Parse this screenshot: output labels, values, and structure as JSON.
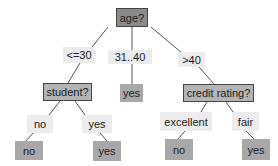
{
  "diagram": {
    "type": "decision-tree",
    "colors": {
      "root_fill": "#8a8a8a",
      "decision_fill": "#b4b4b4",
      "leaf_fill": "#a8a8a8",
      "edge_label_fill": "#ececec",
      "border": "#444444",
      "edge": "#555555"
    },
    "nodes": {
      "root": "age?",
      "student": "student?",
      "middle_leaf": "yes",
      "credit": "credit rating?",
      "student_no_leaf": "no",
      "student_yes_leaf": "yes",
      "credit_excellent_leaf": "no",
      "credit_fair_leaf": "yes"
    },
    "edge_labels": {
      "age_le30": "<=30",
      "age_31_40": "31..40",
      "age_gt40": ">40",
      "student_no": "no",
      "student_yes": "yes",
      "credit_excellent": "excellent",
      "credit_fair": "fair"
    }
  }
}
